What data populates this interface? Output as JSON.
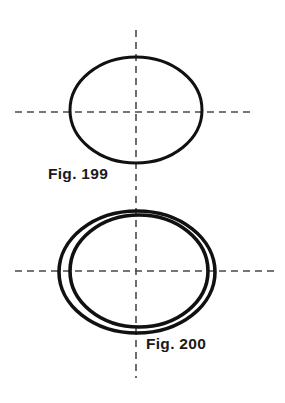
{
  "sheet": {
    "background_color": "#ffffff",
    "width": 285,
    "height": 403,
    "description": "Technical drawing sheet with two ellipse figures and dashed centerlines"
  },
  "style": {
    "outline_color": "#111111",
    "centerline_color": "#4a4a4a",
    "caption_color": "#1a1a1a",
    "outline_width": 3,
    "ring_outline_width": 3.6,
    "centerline_width": 1.6,
    "centerline_dash": "7 5"
  },
  "figures": [
    {
      "id": "fig-199",
      "caption": "Fig. 199",
      "type": "single-ellipse",
      "caption_position": {
        "x": 48,
        "y": 166
      },
      "ellipses": [
        {
          "name": "outline",
          "cx": 136,
          "cy": 110,
          "rx": 66,
          "ry": 53
        }
      ],
      "centerlines": {
        "horizontal": {
          "y": 112,
          "x1": 15,
          "x2": 250
        },
        "vertical": {
          "x": 136,
          "y1": 30,
          "y2": 190
        }
      }
    },
    {
      "id": "fig-200",
      "caption": "Fig. 200",
      "type": "double-ellipse-ring",
      "caption_position": {
        "x": 146,
        "y": 336
      },
      "ellipses": [
        {
          "name": "outer-outline",
          "cx": 137,
          "cy": 272,
          "rx": 78,
          "ry": 61
        },
        {
          "name": "inner-outline",
          "cx": 139,
          "cy": 271,
          "rx": 69,
          "ry": 56
        }
      ],
      "centerlines": {
        "horizontal": {
          "y": 271,
          "x1": 15,
          "x2": 275
        },
        "vertical": {
          "x": 136,
          "y1": 196,
          "y2": 378
        }
      }
    }
  ]
}
